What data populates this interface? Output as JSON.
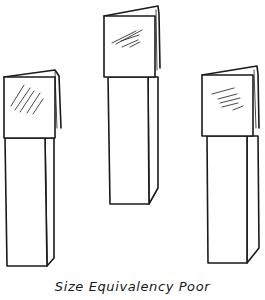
{
  "figure": {
    "caption": "Size Equivalency Poor",
    "stroke_color": "#1a1a1a",
    "background_color": "#ffffff",
    "objects": [
      {
        "name": "left-display",
        "description": "folded sign card on tall pillar"
      },
      {
        "name": "center-display",
        "description": "folded sign card on shorter, raised pillar"
      },
      {
        "name": "right-display",
        "description": "folded sign card on tall pillar"
      }
    ]
  }
}
